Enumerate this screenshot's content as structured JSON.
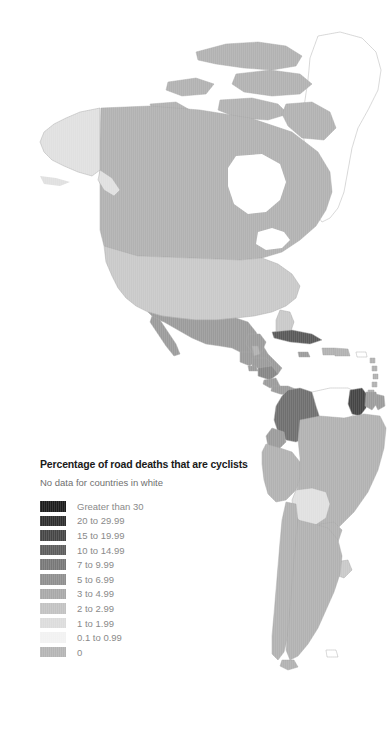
{
  "legend": {
    "title": "Percentage of road deaths that are cyclists",
    "subtitle": "No data for countries in white",
    "items": [
      {
        "label": "Greater than 30",
        "color": "#1c1c1c"
      },
      {
        "label": "20 to 29.99",
        "color": "#2e2e2e"
      },
      {
        "label": "15 to 19.99",
        "color": "#454545"
      },
      {
        "label": "10 to 14.99",
        "color": "#5d5d5d"
      },
      {
        "label": "7 to 9.99",
        "color": "#777777"
      },
      {
        "label": "5 to 6.99",
        "color": "#8f8f8f"
      },
      {
        "label": "3 to 4.99",
        "color": "#a8a8a8"
      },
      {
        "label": "2 to 2.99",
        "color": "#c2c2c2"
      },
      {
        "label": "1 to 1.99",
        "color": "#dcdcdc"
      },
      {
        "label": "0.1 to 0.99",
        "color": "#f2f2f2"
      },
      {
        "label": "0",
        "color": "#b4b4b4"
      }
    ]
  },
  "map": {
    "no_data_color": "#ffffff",
    "border_color": "#9a9a9a",
    "background": "#ffffff",
    "regions": [
      {
        "name": "greenland",
        "bin": "no-data"
      },
      {
        "name": "canada",
        "bin": "3 to 4.99"
      },
      {
        "name": "alaska",
        "bin": "1 to 1.99"
      },
      {
        "name": "united-states",
        "bin": "2 to 2.99"
      },
      {
        "name": "mexico",
        "bin": "5 to 6.99"
      },
      {
        "name": "guatemala",
        "bin": "5 to 6.99"
      },
      {
        "name": "belize",
        "bin": "3 to 4.99"
      },
      {
        "name": "honduras",
        "bin": "5 to 6.99"
      },
      {
        "name": "el-salvador",
        "bin": "5 to 6.99"
      },
      {
        "name": "nicaragua",
        "bin": "7 to 9.99"
      },
      {
        "name": "costa-rica",
        "bin": "5 to 6.99"
      },
      {
        "name": "panama",
        "bin": "5 to 6.99"
      },
      {
        "name": "cuba",
        "bin": "15 to 19.99"
      },
      {
        "name": "jamaica",
        "bin": "5 to 6.99"
      },
      {
        "name": "haiti",
        "bin": "3 to 4.99"
      },
      {
        "name": "dominican-republic",
        "bin": "3 to 4.99"
      },
      {
        "name": "puerto-rico",
        "bin": "no-data"
      },
      {
        "name": "colombia",
        "bin": "10 to 14.99"
      },
      {
        "name": "venezuela",
        "bin": "no-data"
      },
      {
        "name": "guyana",
        "bin": "20 to 29.99"
      },
      {
        "name": "suriname",
        "bin": "5 to 6.99"
      },
      {
        "name": "french-guiana",
        "bin": "5 to 6.99"
      },
      {
        "name": "ecuador",
        "bin": "5 to 6.99"
      },
      {
        "name": "peru",
        "bin": "3 to 4.99"
      },
      {
        "name": "brazil",
        "bin": "3 to 4.99"
      },
      {
        "name": "bolivia",
        "bin": "1 to 1.99"
      },
      {
        "name": "paraguay",
        "bin": "3 to 4.99"
      },
      {
        "name": "chile",
        "bin": "3 to 4.99"
      },
      {
        "name": "argentina",
        "bin": "3 to 4.99"
      },
      {
        "name": "uruguay",
        "bin": "2 to 2.99"
      }
    ]
  }
}
